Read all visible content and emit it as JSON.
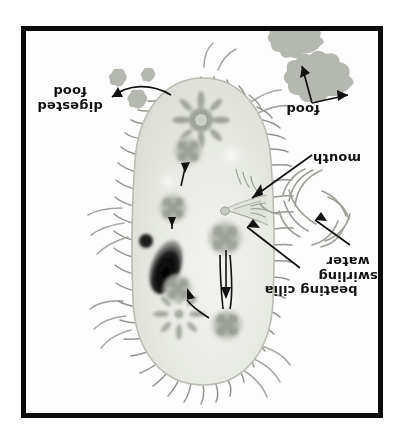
{
  "figure": {
    "orientation": "rotated-180",
    "background_color": "#ffffff",
    "frame_color": "#0a0a0a"
  },
  "labels": [
    {
      "id": "beating-cilia",
      "text": "beating cilia"
    },
    {
      "id": "swirling-water",
      "text": "swirling\nwater"
    },
    {
      "id": "mouth",
      "text": "mouth"
    },
    {
      "id": "food",
      "text": "food"
    },
    {
      "id": "digested-food",
      "text": "digested\nfood"
    }
  ],
  "organism": {
    "name": "paramecium",
    "body_fill": "#e6e8e2",
    "body_edge": "#b9bdb4",
    "cilia_color": "#8d9189",
    "structures": [
      {
        "id": "contractile-vacuole-anterior",
        "shape": "radial-star"
      },
      {
        "id": "macronucleus",
        "shape": "dark-oval",
        "color": "#1d1d1d"
      },
      {
        "id": "micronucleus",
        "shape": "small-dot",
        "color": "#262626"
      },
      {
        "id": "food-vacuole-1",
        "shape": "lobed-circle"
      },
      {
        "id": "food-vacuole-2",
        "shape": "lobed-circle"
      },
      {
        "id": "food-vacuole-3",
        "shape": "lobed-circle"
      },
      {
        "id": "food-vacuole-4",
        "shape": "lobed-circle"
      },
      {
        "id": "food-vacuole-5",
        "shape": "lobed-circle"
      },
      {
        "id": "oral-groove-mouth",
        "shape": "funnel"
      },
      {
        "id": "anal-pore",
        "shape": "radial-star"
      }
    ]
  },
  "particles": {
    "food_color": "#b4b7b0",
    "food_blobs": 2,
    "digested_blobs": 3
  },
  "water": {
    "swirl_color": "#9aa096",
    "swirl_arcs": 12
  }
}
